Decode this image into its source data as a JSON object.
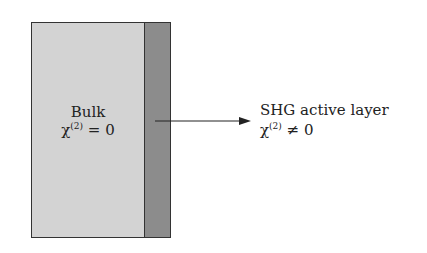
{
  "diagram": {
    "bulk": {
      "title": "Bulk",
      "chi_symbol": "χ",
      "superscript": "(2)",
      "relation": " = 0",
      "fill_color": "#d3d3d3"
    },
    "active_layer": {
      "title": "SHG active layer",
      "chi_symbol": "χ",
      "superscript": "(2)",
      "relation": " ≠ 0",
      "fill_color": "#8c8c8c"
    },
    "arrow": {
      "direction": "right",
      "color": "#222222"
    }
  }
}
